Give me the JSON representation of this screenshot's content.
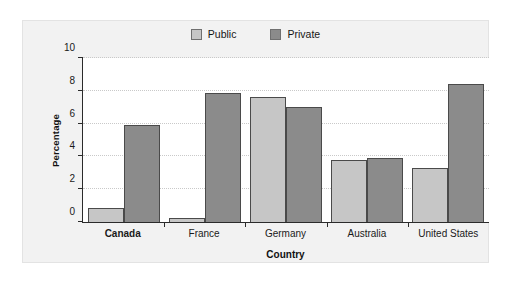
{
  "chart_data": {
    "type": "bar",
    "title": "",
    "subtitle": "",
    "xlabel": "Country",
    "ylabel": "Percentage",
    "categories": [
      "Canada",
      "France",
      "Germany",
      "Australia",
      "United States"
    ],
    "emphasized_category": "Canada",
    "series": [
      {
        "name": "Public",
        "color": "#c6c6c6",
        "values": [
          0.85,
          0.25,
          7.6,
          3.8,
          3.3
        ]
      },
      {
        "name": "Private",
        "color": "#8b8b8b",
        "values": [
          5.9,
          7.85,
          7.0,
          3.9,
          8.4
        ]
      }
    ],
    "ylim": [
      0,
      10
    ],
    "yticks": [
      0,
      2,
      4,
      6,
      8,
      10
    ],
    "ytick_labels": [
      "0",
      "2",
      "4",
      "6",
      "8",
      "10"
    ],
    "grid": true,
    "grid_axis": "y",
    "legend_position": "top-center"
  },
  "legend": {
    "entries": [
      {
        "label": "Public",
        "swatch_color": "#c6c6c6"
      },
      {
        "label": "Private",
        "swatch_color": "#8b8b8b"
      }
    ]
  },
  "colors": {
    "page_background": "#ffffff",
    "panel_background": "#f2f2f2",
    "panel_border": "#e3e3e3",
    "plot_background": "#ffffff",
    "axis": "#2b2b2b",
    "gridline": "#c9c9c9",
    "text": "#1a1a1a"
  }
}
